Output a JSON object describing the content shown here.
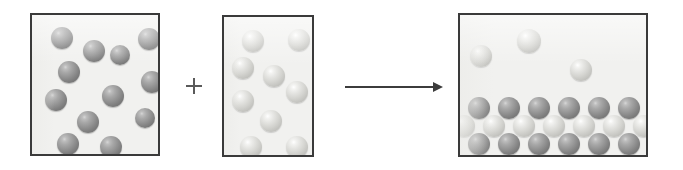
{
  "diagram": {
    "title": "Chemical reaction particle diagram",
    "background_color": "#ffffff",
    "box_fill_color": "#f1f1ef",
    "box_border_color": "#3a3a3a",
    "dark_sphere_color": "#8a8a8a",
    "light_sphere_color": "#d9d9d5",
    "operator_color": "#5a5a5a",
    "arrow_color": "#3c3c3c"
  },
  "operators": {
    "plus": {
      "label": "+",
      "name": "plus-operator",
      "x": 186,
      "y": 78,
      "size": 16
    },
    "arrow": {
      "label": "yields",
      "name": "reaction-arrow",
      "x": 345,
      "y": 82,
      "width": 98,
      "height": 10
    }
  },
  "boxes": [
    {
      "id": "reactant-a",
      "label": "Reactant A container",
      "x": 30,
      "y": 13,
      "width": 130,
      "height": 143,
      "sphere_count": 13,
      "sphere_type": "dark",
      "state": "gas",
      "spheres": [
        {
          "x": 19,
          "y": 12,
          "r": 11,
          "type": "dark"
        },
        {
          "x": 51,
          "y": 25,
          "r": 11,
          "type": "dark"
        },
        {
          "x": 78,
          "y": 30,
          "r": 10,
          "type": "dark"
        },
        {
          "x": 106,
          "y": 13,
          "r": 11,
          "type": "dark"
        },
        {
          "x": 26,
          "y": 46,
          "r": 11,
          "type": "dark"
        },
        {
          "x": 109,
          "y": 56,
          "r": 11,
          "type": "dark"
        },
        {
          "x": 13,
          "y": 74,
          "r": 11,
          "type": "dark"
        },
        {
          "x": 70,
          "y": 70,
          "r": 11,
          "type": "dark"
        },
        {
          "x": 45,
          "y": 96,
          "r": 11,
          "type": "dark"
        },
        {
          "x": 103,
          "y": 93,
          "r": 10,
          "type": "dark"
        },
        {
          "x": 25,
          "y": 118,
          "r": 11,
          "type": "dark"
        },
        {
          "x": 68,
          "y": 121,
          "r": 11,
          "type": "dark"
        },
        {
          "x": 100,
          "y": 56,
          "r": 0,
          "type": "dark"
        }
      ]
    },
    {
      "id": "reactant-b",
      "label": "Reactant B container",
      "x": 222,
      "y": 15,
      "width": 92,
      "height": 142,
      "sphere_count": 9,
      "sphere_type": "light",
      "state": "gas",
      "spheres": [
        {
          "x": 18,
          "y": 13,
          "r": 11,
          "type": "light"
        },
        {
          "x": 64,
          "y": 12,
          "r": 11,
          "type": "light"
        },
        {
          "x": 8,
          "y": 40,
          "r": 11,
          "type": "light"
        },
        {
          "x": 39,
          "y": 48,
          "r": 11,
          "type": "light"
        },
        {
          "x": 8,
          "y": 73,
          "r": 11,
          "type": "light"
        },
        {
          "x": 62,
          "y": 64,
          "r": 11,
          "type": "light"
        },
        {
          "x": 36,
          "y": 93,
          "r": 11,
          "type": "light"
        },
        {
          "x": 16,
          "y": 119,
          "r": 11,
          "type": "light"
        },
        {
          "x": 62,
          "y": 119,
          "r": 11,
          "type": "light"
        }
      ]
    },
    {
      "id": "product",
      "label": "Product container",
      "x": 458,
      "y": 13,
      "width": 190,
      "height": 144,
      "sphere_count": 22,
      "sphere_type": "mixed",
      "state": "solid lattice with excess gas",
      "free_spheres": [
        {
          "x": 10,
          "y": 30,
          "r": 11,
          "type": "light"
        },
        {
          "x": 57,
          "y": 14,
          "r": 12,
          "type": "light"
        },
        {
          "x": 110,
          "y": 44,
          "r": 11,
          "type": "light"
        }
      ],
      "lattice": {
        "rows": 3,
        "row_types": [
          "dark",
          "light",
          "dark"
        ],
        "row_counts": [
          6,
          7,
          6
        ],
        "spheres": [
          {
            "x": 8,
            "y": 82,
            "r": 11,
            "type": "dark"
          },
          {
            "x": 38,
            "y": 82,
            "r": 11,
            "type": "dark"
          },
          {
            "x": 68,
            "y": 82,
            "r": 11,
            "type": "dark"
          },
          {
            "x": 98,
            "y": 82,
            "r": 11,
            "type": "dark"
          },
          {
            "x": 128,
            "y": 82,
            "r": 11,
            "type": "dark"
          },
          {
            "x": 158,
            "y": 82,
            "r": 11,
            "type": "dark"
          },
          {
            "x": 23,
            "y": 100,
            "r": 11,
            "type": "light"
          },
          {
            "x": 53,
            "y": 100,
            "r": 11,
            "type": "light"
          },
          {
            "x": 83,
            "y": 100,
            "r": 11,
            "type": "light"
          },
          {
            "x": 113,
            "y": 100,
            "r": 11,
            "type": "light"
          },
          {
            "x": 143,
            "y": 100,
            "r": 11,
            "type": "light"
          },
          {
            "x": 173,
            "y": 100,
            "r": 11,
            "type": "light"
          },
          {
            "x": -7,
            "y": 100,
            "r": 11,
            "type": "light"
          },
          {
            "x": 8,
            "y": 118,
            "r": 11,
            "type": "dark"
          },
          {
            "x": 38,
            "y": 118,
            "r": 11,
            "type": "dark"
          },
          {
            "x": 68,
            "y": 118,
            "r": 11,
            "type": "dark"
          },
          {
            "x": 98,
            "y": 118,
            "r": 11,
            "type": "dark"
          },
          {
            "x": 128,
            "y": 118,
            "r": 11,
            "type": "dark"
          },
          {
            "x": 158,
            "y": 118,
            "r": 11,
            "type": "dark"
          }
        ]
      }
    }
  ]
}
